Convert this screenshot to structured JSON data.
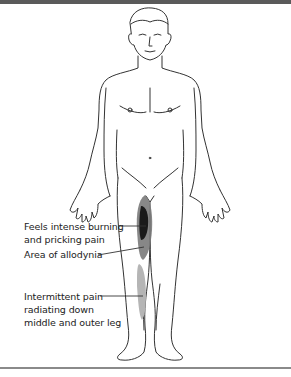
{
  "diagram": {
    "colors": {
      "top_bar": "#5a5a5a",
      "bottom_rule": "#8a8a8a",
      "outline": "#333333",
      "burning_pain": "#1a1a1a",
      "allodynia": "#7a7a7a",
      "intermittent_pain": "#b5b5b5"
    },
    "labels": [
      {
        "id": "burning",
        "lines": [
          "Feels intense burning",
          "and pricking pain"
        ]
      },
      {
        "id": "allodynia",
        "lines": [
          "Area of allodynia"
        ]
      },
      {
        "id": "intermittent",
        "lines": [
          "Intermittent pain",
          "radiating down",
          "middle and outer leg"
        ]
      }
    ]
  }
}
